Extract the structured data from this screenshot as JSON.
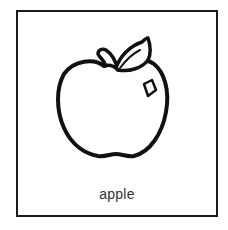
{
  "card": {
    "label": "apple",
    "image": {
      "icon": "apple-icon",
      "style": "black line drawing"
    },
    "colors": {
      "border": "#1a1a1a",
      "background": "#ffffff",
      "label_text": "#333333"
    }
  }
}
